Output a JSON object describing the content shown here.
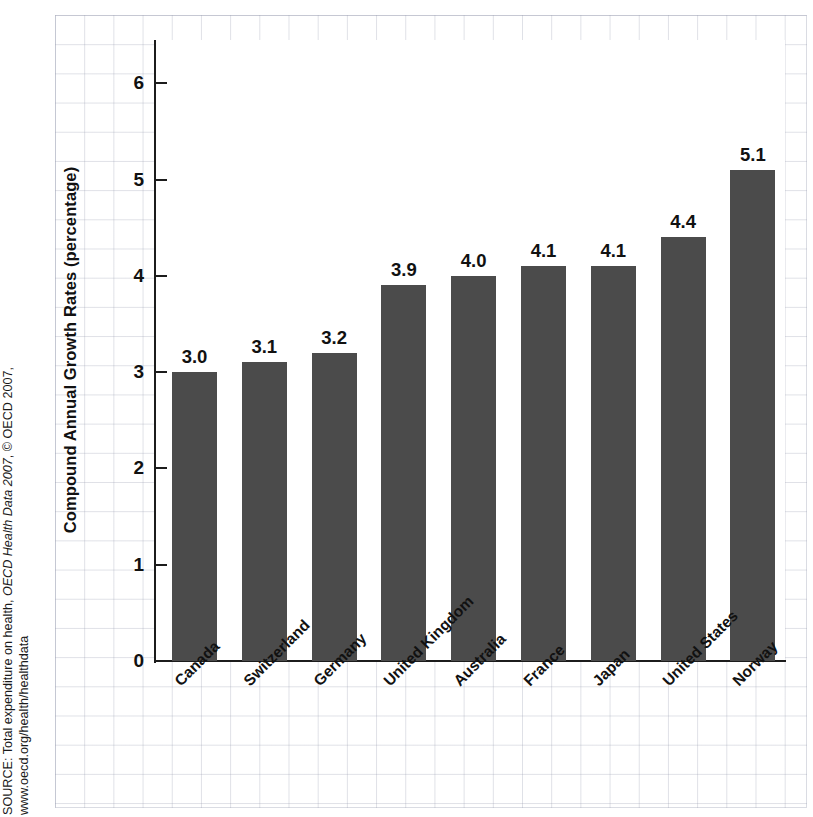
{
  "chart_data": {
    "type": "bar",
    "title": "",
    "xlabel": "",
    "ylabel": "Compound Annual Growth Rates (percentage)",
    "ylim": [
      0,
      6.5
    ],
    "yticks": [
      "0",
      "1",
      "2",
      "3",
      "4",
      "5",
      "6"
    ],
    "grid": true,
    "legend": "none",
    "bar_color": "#4b4b4b",
    "categories": [
      "Canada",
      "Switzerland",
      "Germany",
      "United Kingdom",
      "Australia",
      "France",
      "Japan",
      "United States",
      "Norway"
    ],
    "values": [
      3.0,
      3.1,
      3.2,
      3.9,
      4.0,
      4.1,
      4.1,
      4.4,
      5.1
    ],
    "data_labels": [
      "3.0",
      "3.1",
      "3.2",
      "3.9",
      "4.0",
      "4.1",
      "4.1",
      "4.4",
      "5.1"
    ]
  },
  "source": {
    "line1_prefix": "SOURCE: Total expenditure on health, ",
    "line1_italic": "OECD Health Data 2007",
    "line1_suffix": ", © OECD 2007,",
    "line2": "www.oecd.org/health/healthdata"
  }
}
